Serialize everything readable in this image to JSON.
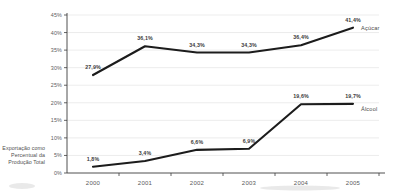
{
  "chart_data": {
    "type": "line",
    "title": "",
    "xlabel": "",
    "ylabel": "Exportação como Percentual da Produção Total",
    "categories": [
      "2000",
      "2001",
      "2002",
      "2003",
      "2004",
      "2005"
    ],
    "ylim": [
      0,
      45
    ],
    "ytick_values": [
      0,
      5,
      10,
      15,
      20,
      25,
      30,
      35,
      40,
      45
    ],
    "ytick_labels": [
      "0%",
      "5%",
      "10%",
      "15%",
      "20%",
      "25%",
      "30%",
      "35%",
      "40%",
      "45%"
    ],
    "grid": true,
    "legend_position": "right-of-line-end",
    "series": [
      {
        "name": "Açúcar",
        "values": [
          27.9,
          36.1,
          34.3,
          34.3,
          36.4,
          41.4
        ],
        "labels": [
          "27,9%",
          "36,1%",
          "34,3%",
          "34,3%",
          "36,4%",
          "41,4%"
        ],
        "color": "#1c1c1c"
      },
      {
        "name": "Álcool",
        "values": [
          1.8,
          3.4,
          6.6,
          6.9,
          19.6,
          19.7
        ],
        "labels": [
          "1,8%",
          "3,4%",
          "6,6%",
          "6,9%",
          "19,6%",
          "19,7%"
        ],
        "color": "#1c1c1c"
      }
    ]
  },
  "axis": {
    "y_title_line1": "Exportação como",
    "y_title_line2": "Percentual da",
    "y_title_line3": "Produção Total"
  },
  "colors": {
    "line": "#1c1c1c",
    "grid": "#d8d8d8",
    "axis": "#3c3c3c",
    "text": "#4a4a4a",
    "background": "#ffffff"
  }
}
